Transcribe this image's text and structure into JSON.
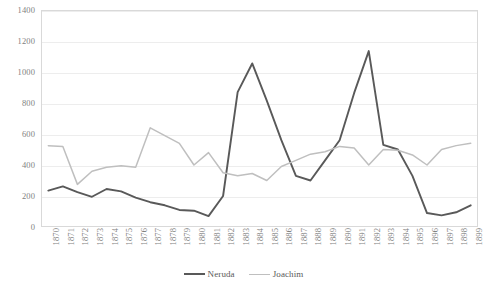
{
  "chart_data": {
    "type": "line",
    "title": "",
    "xlabel": "",
    "ylabel": "",
    "ylim": [
      0,
      1400
    ],
    "yticks": [
      0,
      200,
      400,
      600,
      800,
      1000,
      1200,
      1400
    ],
    "grid": true,
    "legend_position": "bottom",
    "categories": [
      "1870",
      "1871",
      "1872",
      "1873",
      "1874",
      "1875",
      "1876",
      "1877",
      "1878",
      "1879",
      "1880",
      "1881",
      "1882",
      "1883",
      "1884",
      "1885",
      "1886",
      "1887",
      "1888",
      "1889",
      "1890",
      "1891",
      "1892",
      "1893",
      "1894",
      "1895",
      "1896",
      "1897",
      "1898",
      "1899"
    ],
    "series": [
      {
        "name": "Neruda",
        "color": "#595959",
        "values": [
          235,
          262,
          225,
          195,
          245,
          230,
          190,
          160,
          140,
          110,
          105,
          70,
          200,
          870,
          1055,
          815,
          560,
          330,
          300,
          430,
          560,
          865,
          1135,
          530,
          500,
          330,
          90,
          75,
          95,
          140
        ]
      },
      {
        "name": "Joachim",
        "color": "#bfbfbf",
        "values": [
          525,
          520,
          275,
          360,
          385,
          395,
          385,
          640,
          590,
          540,
          400,
          480,
          350,
          330,
          345,
          300,
          390,
          430,
          470,
          485,
          520,
          510,
          400,
          500,
          495,
          465,
          400,
          500,
          525,
          540
        ]
      }
    ]
  },
  "legend": {
    "items": [
      {
        "label": "Neruda"
      },
      {
        "label": "Joachim"
      }
    ]
  },
  "colors": {
    "neruda": "#595959",
    "joachim": "#bfbfbf",
    "gridline": "#ededed",
    "frame": "#d9d9d9",
    "tick_text": "#7f7f7f"
  }
}
